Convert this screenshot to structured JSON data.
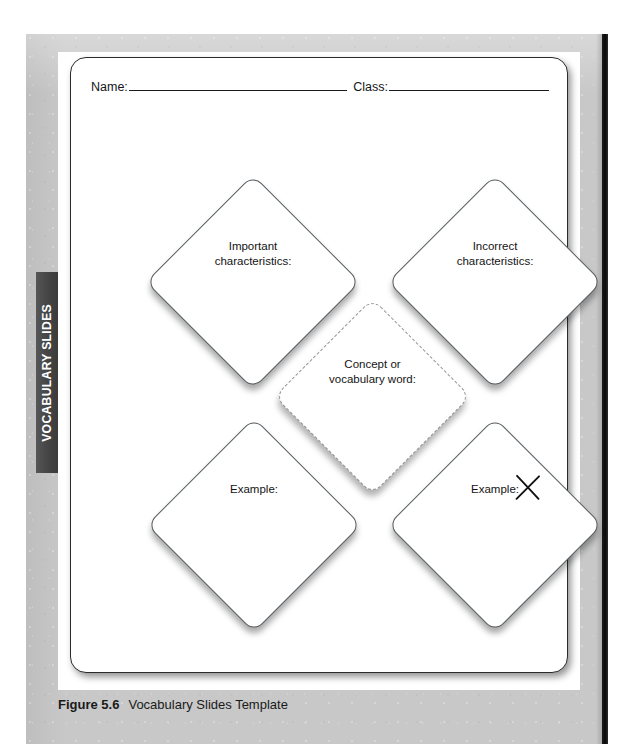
{
  "page": {
    "side_tab_label": "VOCABULARY SLIDES",
    "caption_number": "Figure 5.6",
    "caption_title": "Vocabulary Slides Template"
  },
  "worksheet": {
    "header": {
      "name_label": "Name:",
      "name_value": "",
      "class_label": "Class:",
      "class_value": ""
    },
    "diamonds": [
      {
        "id": "important",
        "label": "Important\ncharacteristics:",
        "line1": "Important",
        "line2": "characteristics:",
        "border_style": "solid",
        "marked_out": false
      },
      {
        "id": "incorrect",
        "label": "Incorrect\ncharacteristics:",
        "line1": "Incorrect",
        "line2": "characteristics:",
        "border_style": "solid",
        "marked_out": false
      },
      {
        "id": "concept",
        "label": "Concept or\nvocabulary word:",
        "line1": "Concept or",
        "line2": "vocabulary word:",
        "border_style": "dashed",
        "marked_out": false
      },
      {
        "id": "example",
        "label": "Example:",
        "line1": "Example:",
        "line2": "",
        "border_style": "solid",
        "marked_out": false
      },
      {
        "id": "non-example",
        "label": "Example:",
        "line1": "Example:",
        "line2": "",
        "border_style": "solid",
        "marked_out": true
      }
    ]
  },
  "colors": {
    "page_background": "#c8c8c8",
    "sheet": "#ffffff",
    "tab_background": "#4a4a4a",
    "tab_text": "#ffffff",
    "shape_border": "#555b5f",
    "dashed_border": "#8a8f93",
    "text": "#141414",
    "page_edge": "#0a0a0a"
  }
}
